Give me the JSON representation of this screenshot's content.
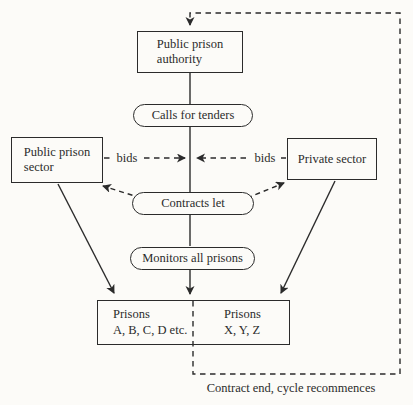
{
  "diagram": {
    "nodes": {
      "authority": {
        "line1": "Public prison",
        "line2": "authority"
      },
      "calls_for_tenders": {
        "label": "Calls for tenders"
      },
      "public_sector": {
        "line1": "Public prison",
        "line2": "sector"
      },
      "private_sector": {
        "label": "Private sector"
      },
      "contracts_let": {
        "label": "Contracts let"
      },
      "monitors": {
        "label": "Monitors all prisons"
      },
      "prisons_public": {
        "line1": "Prisons",
        "line2": "A, B, C, D etc."
      },
      "prisons_private": {
        "line1": "Prisons",
        "line2": "X, Y, Z"
      }
    },
    "edge_labels": {
      "bids_left": "bids",
      "bids_right": "bids",
      "cycle_note": "Contract end, cycle recommences"
    },
    "colors": {
      "ink": "#2b2b2b",
      "paper": "#fcfbf8"
    }
  }
}
